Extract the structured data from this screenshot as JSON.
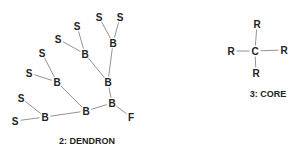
{
  "dendron": {
    "label": "2: DENDRON",
    "atoms": [
      {
        "id": "s1",
        "symbol": "S",
        "x": 99,
        "y": 17
      },
      {
        "id": "s2",
        "symbol": "S",
        "x": 120,
        "y": 17
      },
      {
        "id": "b1",
        "symbol": "B",
        "x": 113,
        "y": 43
      },
      {
        "id": "s3",
        "symbol": "S",
        "x": 77,
        "y": 26
      },
      {
        "id": "s4",
        "symbol": "S",
        "x": 58,
        "y": 39
      },
      {
        "id": "b2",
        "symbol": "B",
        "x": 85,
        "y": 54
      },
      {
        "id": "s5",
        "symbol": "S",
        "x": 42,
        "y": 53
      },
      {
        "id": "s6",
        "symbol": "S",
        "x": 29,
        "y": 73
      },
      {
        "id": "b3",
        "symbol": "B",
        "x": 57,
        "y": 82
      },
      {
        "id": "b4",
        "symbol": "B",
        "x": 108,
        "y": 82
      },
      {
        "id": "s7",
        "symbol": "S",
        "x": 21,
        "y": 98
      },
      {
        "id": "b5",
        "symbol": "B",
        "x": 86,
        "y": 111
      },
      {
        "id": "b6",
        "symbol": "B",
        "x": 112,
        "y": 103
      },
      {
        "id": "b7",
        "symbol": "B",
        "x": 45,
        "y": 117
      },
      {
        "id": "s8",
        "symbol": "S",
        "x": 15,
        "y": 121
      },
      {
        "id": "f1",
        "symbol": "F",
        "x": 131,
        "y": 117
      }
    ],
    "bonds": [
      [
        "s1",
        "b1"
      ],
      [
        "s2",
        "b1"
      ],
      [
        "b1",
        "b4"
      ],
      [
        "s3",
        "b2"
      ],
      [
        "s4",
        "b2"
      ],
      [
        "b2",
        "b4"
      ],
      [
        "s5",
        "b3"
      ],
      [
        "s6",
        "b3"
      ],
      [
        "b3",
        "b5"
      ],
      [
        "b4",
        "b6"
      ],
      [
        "b6",
        "b5"
      ],
      [
        "b6",
        "f1"
      ],
      [
        "b5",
        "b7"
      ],
      [
        "s7",
        "b7"
      ],
      [
        "s8",
        "b7"
      ]
    ]
  },
  "core": {
    "label": "3: CORE",
    "atoms": [
      {
        "id": "c",
        "symbol": "C",
        "x": 255,
        "y": 51
      },
      {
        "id": "r_top",
        "symbol": "R",
        "x": 257,
        "y": 24
      },
      {
        "id": "r_left",
        "symbol": "R",
        "x": 231,
        "y": 51
      },
      {
        "id": "r_right",
        "symbol": "R",
        "x": 284,
        "y": 50
      },
      {
        "id": "r_bottom",
        "symbol": "R",
        "x": 256,
        "y": 73
      }
    ],
    "bonds": [
      [
        "c",
        "r_top"
      ],
      [
        "c",
        "r_left"
      ],
      [
        "c",
        "r_right"
      ],
      [
        "c",
        "r_bottom"
      ]
    ]
  }
}
